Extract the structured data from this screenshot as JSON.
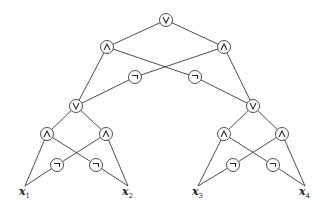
{
  "diagram": {
    "gates": {
      "or": "∨",
      "and": "∧",
      "not": "¬"
    },
    "nodes": [
      {
        "id": "g0",
        "type": "or",
        "x": 166,
        "y": 20
      },
      {
        "id": "g1",
        "type": "and",
        "x": 107,
        "y": 47
      },
      {
        "id": "g2",
        "type": "and",
        "x": 224,
        "y": 47
      },
      {
        "id": "g3",
        "type": "not",
        "x": 135,
        "y": 77
      },
      {
        "id": "g4",
        "type": "not",
        "x": 195,
        "y": 77
      },
      {
        "id": "g5",
        "type": "or",
        "x": 76,
        "y": 106
      },
      {
        "id": "g6",
        "type": "or",
        "x": 253,
        "y": 106
      },
      {
        "id": "g7",
        "type": "and",
        "x": 47,
        "y": 134
      },
      {
        "id": "g8",
        "type": "and",
        "x": 106,
        "y": 134
      },
      {
        "id": "g9",
        "type": "not",
        "x": 57,
        "y": 165
      },
      {
        "id": "g10",
        "type": "not",
        "x": 96,
        "y": 165
      },
      {
        "id": "g11",
        "type": "and",
        "x": 224,
        "y": 134
      },
      {
        "id": "g12",
        "type": "and",
        "x": 282,
        "y": 134
      },
      {
        "id": "g13",
        "type": "not",
        "x": 233,
        "y": 165
      },
      {
        "id": "g14",
        "type": "not",
        "x": 273,
        "y": 165
      }
    ],
    "leaves": [
      {
        "id": "x1",
        "label": "x",
        "sub": "1",
        "x": 25,
        "y": 190
      },
      {
        "id": "x2",
        "label": "x",
        "sub": "2",
        "x": 128,
        "y": 190
      },
      {
        "id": "x3",
        "label": "x",
        "sub": "3",
        "x": 198,
        "y": 190
      },
      {
        "id": "x4",
        "label": "x",
        "sub": "4",
        "x": 305,
        "y": 190
      }
    ],
    "edges": [
      [
        "g0",
        "g1"
      ],
      [
        "g0",
        "g2"
      ],
      [
        "g1",
        "g5"
      ],
      [
        "g1",
        "g4"
      ],
      [
        "g2",
        "g3"
      ],
      [
        "g2",
        "g6"
      ],
      [
        "g3",
        "g5"
      ],
      [
        "g4",
        "g6"
      ],
      [
        "g5",
        "g7"
      ],
      [
        "g5",
        "g8"
      ],
      [
        "g7",
        "x1"
      ],
      [
        "g7",
        "g10"
      ],
      [
        "g8",
        "g9"
      ],
      [
        "g8",
        "x2"
      ],
      [
        "g9",
        "x1"
      ],
      [
        "g10",
        "x2"
      ],
      [
        "g6",
        "g11"
      ],
      [
        "g6",
        "g12"
      ],
      [
        "g11",
        "x3"
      ],
      [
        "g11",
        "g14"
      ],
      [
        "g12",
        "g13"
      ],
      [
        "g12",
        "x4"
      ],
      [
        "g13",
        "x3"
      ],
      [
        "g14",
        "x4"
      ]
    ],
    "colors": {
      "line": "#3a3a3a",
      "background": "#ffffff"
    }
  }
}
